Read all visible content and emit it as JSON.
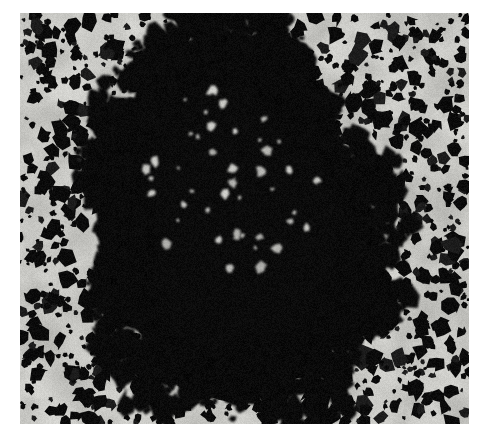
{
  "figure": {
    "kind": "grayscale-micrograph",
    "caption": "",
    "title": "",
    "labels": [],
    "page_background_color": "#ffffff",
    "plate": {
      "left": 20,
      "top": 13,
      "width": 449,
      "height": 411
    },
    "colors": {
      "background_gray": "#c9c9c5",
      "background_gray_light": "#d6d6d2",
      "background_gray_dark": "#b4b4b0",
      "grain_black": "#0b0b0b",
      "grain_soft": "#1c1c1c",
      "paper_white": "#ffffff"
    },
    "background_field": {
      "mean_gray_level": 200,
      "grain_density_per_1000px2": 2.6,
      "grain_radius_px": [
        2,
        9
      ],
      "noise_amplitude": 14
    },
    "cluster": {
      "shape": "oval",
      "center_x": 238,
      "center_y": 222,
      "radius_x": 106,
      "radius_y": 146,
      "rotation_deg": -8,
      "core_fill": "solid-black",
      "edge": "ragged-stippled",
      "edge_falloff_px": 58,
      "satellite_grain_radius_px": [
        3,
        14
      ],
      "coverage_fraction_core": 1.0,
      "coverage_fraction_halo": 0.45,
      "top_extent_y": 55,
      "bottom_extent_y": 392,
      "left_extent_x": 128,
      "right_extent_x": 352
    },
    "render_seed": 20240517
  }
}
